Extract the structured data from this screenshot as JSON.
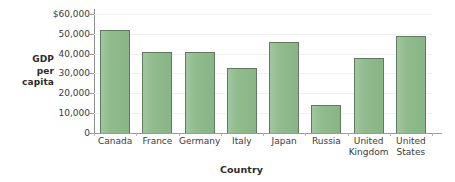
{
  "chart_data": {
    "type": "bar",
    "title": "",
    "xlabel": "Country",
    "ylabel": "GDP per capita",
    "ylabel_lines": [
      "GDP",
      "per",
      "capita"
    ],
    "categories": [
      "Canada",
      "France",
      "Germany",
      "Italy",
      "Japan",
      "Russia",
      "United Kingdom",
      "United States"
    ],
    "category_lines": [
      [
        "Canada"
      ],
      [
        "France"
      ],
      [
        "Germany"
      ],
      [
        "Italy"
      ],
      [
        "Japan"
      ],
      [
        "Russia"
      ],
      [
        "United",
        "Kingdom"
      ],
      [
        "United",
        "States"
      ]
    ],
    "values": [
      52000,
      41000,
      41000,
      33000,
      46000,
      14000,
      38000,
      49000
    ],
    "ylim": [
      0,
      62000
    ],
    "yticks": [
      0,
      10000,
      20000,
      30000,
      40000,
      50000,
      60000
    ],
    "ytick_labels": [
      "0",
      "10,000",
      "20,000",
      "30,000",
      "40,000",
      "50,000",
      "$60,000"
    ],
    "grid": false,
    "legend": null,
    "bar_fill_color": "#8dba8b",
    "bar_border_color": "#5f7a5e",
    "axis_color": "#9a9a9a",
    "background_color": "#ffffff"
  }
}
